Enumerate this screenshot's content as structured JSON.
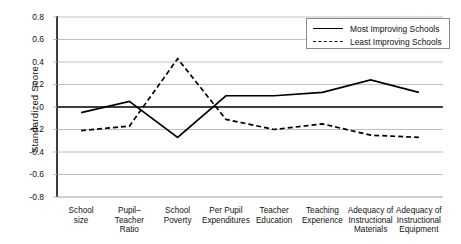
{
  "chart_data": {
    "type": "line",
    "title": "",
    "xlabel": "",
    "ylabel": "Standardized Score",
    "ylim": [
      -0.8,
      0.8
    ],
    "ytick_step": 0.2,
    "grid": true,
    "legend_position": "top-right",
    "categories": [
      "School size",
      "Pupil–Teacher Ratio",
      "School Poverty",
      "Per Pupil Expenditures",
      "Teacher Education",
      "Teaching Experience",
      "Adequacy of Instructional Materials",
      "Adequacy of Instructional Equipment"
    ],
    "category_lines": [
      [
        "School",
        "size"
      ],
      [
        "Pupil–",
        "Teacher",
        "Ratio"
      ],
      [
        "School",
        "Poverty"
      ],
      [
        "Per Pupil",
        "Expenditures"
      ],
      [
        "Teacher",
        "Education"
      ],
      [
        "Teaching",
        "Experience"
      ],
      [
        "Adequacy of",
        "Instructional",
        "Materials"
      ],
      [
        "Adequacy of",
        "Instructional",
        "Equipment"
      ]
    ],
    "yticks": [
      "0.8",
      "0.6",
      "0.4",
      "0.2",
      "0",
      "-0.2",
      "-0.4",
      "-0.6",
      "-0.8"
    ],
    "ytick_values": [
      0.8,
      0.6,
      0.4,
      0.2,
      0,
      -0.2,
      -0.4,
      -0.6,
      -0.8
    ],
    "series": [
      {
        "name": "Most Improving Schools",
        "style": "solid",
        "color": "#000000",
        "values": [
          -0.05,
          0.05,
          -0.27,
          0.1,
          0.1,
          0.13,
          0.24,
          0.13
        ]
      },
      {
        "name": "Least Improving Schools",
        "style": "dashed",
        "color": "#000000",
        "values": [
          -0.21,
          -0.17,
          0.43,
          -0.11,
          -0.2,
          -0.15,
          -0.25,
          -0.27
        ]
      }
    ]
  },
  "legend": {
    "items": [
      {
        "label": "Most Improving Schools",
        "style": "solid"
      },
      {
        "label": "Least Improving Schools",
        "style": "dashed"
      }
    ]
  },
  "axes": {
    "y_title": "Standardized Score"
  },
  "colors": {
    "line": "#000000",
    "grid": "#b9b9b9",
    "axis": "#1a1a1a",
    "zero_line": "#000000",
    "background": "#ffffff"
  }
}
